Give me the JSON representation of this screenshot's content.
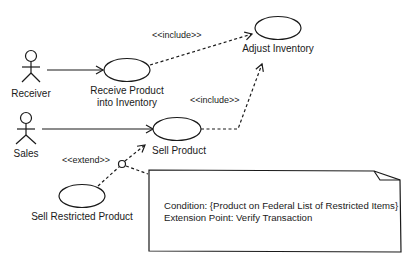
{
  "diagram": {
    "type": "uml-use-case",
    "actors": [
      {
        "id": "receiver",
        "label": "Receiver"
      },
      {
        "id": "sales",
        "label": "Sales"
      }
    ],
    "use_cases": [
      {
        "id": "receive",
        "label_line1": "Receive Product",
        "label_line2": "into Inventory"
      },
      {
        "id": "adjust",
        "label": "Adjust Inventory"
      },
      {
        "id": "sell",
        "label": "Sell Product"
      },
      {
        "id": "restricted",
        "label": "Sell Restricted Product"
      }
    ],
    "relationships": [
      {
        "from": "receiver",
        "to": "receive",
        "kind": "association"
      },
      {
        "from": "sales",
        "to": "sell",
        "kind": "association"
      },
      {
        "from": "receive",
        "to": "adjust",
        "kind": "include",
        "label": "<<include>>"
      },
      {
        "from": "sell",
        "to": "adjust",
        "kind": "include",
        "label": "<<include>>"
      },
      {
        "from": "restricted",
        "to": "sell",
        "kind": "extend",
        "label": "<<extend>>"
      }
    ],
    "note": {
      "line1": "Condition: {Product on Federal List of Restricted Items}",
      "line2": "Extension Point: Verify Transaction"
    },
    "colors": {
      "stroke": "#1a1a1a",
      "background": "#ffffff"
    }
  }
}
